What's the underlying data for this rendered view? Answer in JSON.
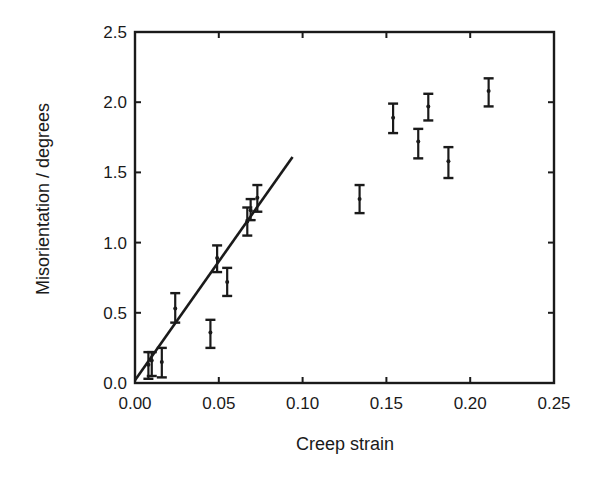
{
  "chart_data": {
    "type": "scatter",
    "title": "",
    "xlabel": "Creep strain",
    "ylabel": "Misorientation / degrees",
    "xlim": [
      0.0,
      0.25
    ],
    "ylim": [
      0.0,
      2.5
    ],
    "xticks": [
      0.0,
      0.05,
      0.1,
      0.15,
      0.2,
      0.25
    ],
    "xtick_labels": [
      "0.00",
      "0.05",
      "0.10",
      "0.15",
      "0.20",
      "0.25"
    ],
    "yticks": [
      0.0,
      0.5,
      1.0,
      1.5,
      2.0,
      2.5
    ],
    "ytick_labels": [
      "0.0",
      "0.5",
      "1.0",
      "1.5",
      "2.0",
      "2.5"
    ],
    "grid": false,
    "legend": null,
    "series": [
      {
        "name": "measurements",
        "style": "errorbar",
        "points": [
          {
            "x": 0.008,
            "y": 0.13,
            "yerr_low": 0.03,
            "yerr_high": 0.22
          },
          {
            "x": 0.01,
            "y": 0.16,
            "yerr_low": 0.05,
            "yerr_high": 0.22
          },
          {
            "x": 0.016,
            "y": 0.15,
            "yerr_low": 0.04,
            "yerr_high": 0.25
          },
          {
            "x": 0.024,
            "y": 0.53,
            "yerr_low": 0.43,
            "yerr_high": 0.64
          },
          {
            "x": 0.045,
            "y": 0.36,
            "yerr_low": 0.25,
            "yerr_high": 0.45
          },
          {
            "x": 0.049,
            "y": 0.89,
            "yerr_low": 0.79,
            "yerr_high": 0.98
          },
          {
            "x": 0.055,
            "y": 0.72,
            "yerr_low": 0.62,
            "yerr_high": 0.82
          },
          {
            "x": 0.067,
            "y": 1.15,
            "yerr_low": 1.05,
            "yerr_high": 1.25
          },
          {
            "x": 0.069,
            "y": 1.23,
            "yerr_low": 1.16,
            "yerr_high": 1.31
          },
          {
            "x": 0.073,
            "y": 1.32,
            "yerr_low": 1.22,
            "yerr_high": 1.41
          },
          {
            "x": 0.134,
            "y": 1.31,
            "yerr_low": 1.21,
            "yerr_high": 1.41
          },
          {
            "x": 0.154,
            "y": 1.89,
            "yerr_low": 1.78,
            "yerr_high": 1.99
          },
          {
            "x": 0.169,
            "y": 1.72,
            "yerr_low": 1.6,
            "yerr_high": 1.81
          },
          {
            "x": 0.175,
            "y": 1.97,
            "yerr_low": 1.87,
            "yerr_high": 2.06
          },
          {
            "x": 0.187,
            "y": 1.58,
            "yerr_low": 1.46,
            "yerr_high": 1.68
          },
          {
            "x": 0.211,
            "y": 2.08,
            "yerr_low": 1.97,
            "yerr_high": 2.17
          }
        ]
      },
      {
        "name": "linear fit",
        "style": "line",
        "x": [
          0.0,
          0.094
        ],
        "y": [
          0.02,
          1.61
        ]
      }
    ]
  },
  "layout": {
    "plot": {
      "left": 135,
      "top": 32,
      "right": 554,
      "bottom": 383
    },
    "colors": {
      "ink": "#1a1a1a",
      "background": "#ffffff"
    }
  }
}
